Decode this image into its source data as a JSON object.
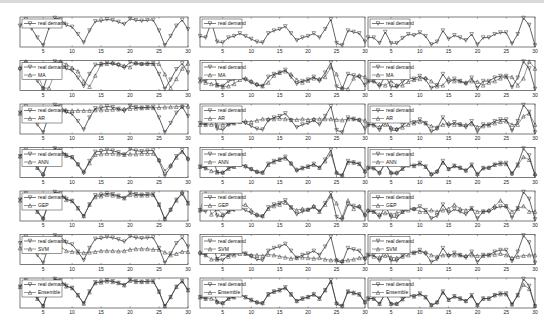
{
  "chart_data": {
    "type": "line",
    "layout": "3 columns x 7 rows of small-multiple line plots",
    "x": [
      1,
      2,
      3,
      4,
      5,
      6,
      7,
      8,
      9,
      10,
      11,
      12,
      13,
      14,
      15,
      16,
      17,
      18,
      19,
      20,
      21,
      22,
      23,
      24,
      25,
      26,
      27,
      28,
      29,
      30
    ],
    "xlim": [
      1,
      30
    ],
    "x_ticks": [
      "5",
      "10",
      "15",
      "20",
      "25",
      "30"
    ],
    "ylim": [
      0,
      1
    ],
    "y_note": "values are relative (normalized) demand levels estimated from plot heights; y tick labels are not legible",
    "row_models": [
      "",
      "MA",
      "AR",
      "ANN",
      "GEP",
      "SVM",
      "Ensemble"
    ],
    "legend_real_label": "real demand",
    "columns": [
      {
        "name": "series-1",
        "real": [
          0.72,
          0.95,
          0.62,
          0.3,
          0.02,
          0.65,
          1,
          0.95,
          0.75,
          0.68,
          0.42,
          0.12,
          0.55,
          0.88,
          0.9,
          0.95,
          0.92,
          0.86,
          0.78,
          0.97,
          0.92,
          0.9,
          0.92,
          0.93,
          0.55,
          0.02,
          0.35,
          0.72,
          0.93,
          0.6
        ],
        "models": {
          "MA": [
            0.78,
            1,
            0.78,
            0.55,
            0.05,
            0.05,
            0.6,
            1,
            0.9,
            0.78,
            0.65,
            0.3,
            0.1,
            0.5,
            0.9,
            0.92,
            0.95,
            0.92,
            0.85,
            0.8,
            0.95,
            0.92,
            0.92,
            0.92,
            0.92,
            0.55,
            0.05,
            0.38,
            0.75,
            0.93
          ],
          "AR": [
            0.7,
            0.72,
            0.72,
            0.72,
            0.72,
            0.72,
            0.74,
            0.78,
            0.8,
            0.8,
            0.8,
            0.8,
            0.8,
            0.82,
            0.82,
            0.83,
            0.84,
            0.85,
            0.86,
            0.87,
            0.88,
            0.89,
            0.9,
            0.9,
            0.91,
            0.92,
            0.93,
            0.94,
            0.95,
            0.95
          ],
          "ANN": [
            0.72,
            0.9,
            0.62,
            0.32,
            0.1,
            0.6,
            0.95,
            0.9,
            0.75,
            0.7,
            0.45,
            0.18,
            0.48,
            0.78,
            0.8,
            0.82,
            0.82,
            0.8,
            0.78,
            0.8,
            0.8,
            0.82,
            0.82,
            0.82,
            0.6,
            0.2,
            0.4,
            0.68,
            0.88,
            0.65
          ],
          "GEP": [
            0.7,
            0.92,
            0.6,
            0.3,
            0.08,
            0.62,
            0.95,
            0.9,
            0.72,
            0.68,
            0.42,
            0.15,
            0.55,
            0.82,
            0.85,
            0.9,
            0.88,
            0.84,
            0.78,
            0.9,
            0.88,
            0.88,
            0.88,
            0.9,
            0.55,
            0.05,
            0.38,
            0.7,
            1,
            0.6
          ],
          "SVM": [
            0.55,
            0.6,
            0.5,
            0.45,
            0.4,
            0.45,
            0.55,
            0.6,
            0.45,
            0.42,
            0.4,
            0.38,
            0.4,
            0.42,
            0.45,
            0.45,
            0.45,
            0.44,
            0.45,
            0.5,
            0.52,
            0.52,
            0.52,
            0.5,
            0.5,
            0.4,
            0.3,
            0.35,
            0.42,
            0.42
          ],
          "Ensemble": [
            0.72,
            0.93,
            0.62,
            0.3,
            0.05,
            0.63,
            0.98,
            0.93,
            0.74,
            0.68,
            0.42,
            0.13,
            0.53,
            0.86,
            0.88,
            0.92,
            0.9,
            0.86,
            0.78,
            0.94,
            0.9,
            0.9,
            0.9,
            0.91,
            0.55,
            0.04,
            0.36,
            0.72,
            0.92,
            0.6
          ]
        }
      },
      {
        "name": "series-2",
        "real": [
          0.35,
          0.3,
          0.85,
          0.15,
          0.12,
          0.3,
          0.35,
          0.45,
          0.35,
          0.25,
          0.15,
          0.12,
          0.45,
          0.55,
          0.6,
          0.7,
          0.45,
          0.2,
          0.3,
          0.35,
          0.45,
          0.3,
          0.6,
          0.95,
          0.1,
          0.02,
          0.55,
          0.5,
          0.45,
          0.15
        ],
        "models": {
          "MA": [
            0.3,
            0.25,
            0.2,
            0.15,
            0.1,
            0.12,
            0.2,
            0.35,
            0.4,
            0.3,
            0.2,
            0.12,
            0.25,
            0.5,
            0.6,
            0.65,
            0.55,
            0.35,
            0.25,
            0.32,
            0.4,
            0.38,
            0.45,
            0.8,
            0.55,
            0.05,
            0.02,
            0.4,
            0.5,
            0.45
          ],
          "AR": [
            0.3,
            0.3,
            0.3,
            0.28,
            0.3,
            0.32,
            0.35,
            0.4,
            0.42,
            0.4,
            0.45,
            0.5,
            0.5,
            0.5,
            0.52,
            0.5,
            0.48,
            0.48,
            0.5,
            0.48,
            0.5,
            0.5,
            0.5,
            0.5,
            0.48,
            0.46,
            0.5,
            0.5,
            0.48,
            0.45
          ],
          "ANN": [
            0.35,
            0.3,
            0.2,
            0.15,
            0.15,
            0.28,
            0.35,
            0.42,
            0.38,
            0.28,
            0.18,
            0.15,
            0.42,
            0.52,
            0.6,
            0.65,
            0.48,
            0.25,
            0.3,
            0.35,
            0.42,
            0.32,
            0.55,
            0.8,
            0.15,
            0.05,
            0.5,
            0.5,
            0.45,
            0.2
          ],
          "GEP": [
            0.35,
            0.95,
            0.2,
            0.4,
            0.2,
            0.3,
            0.45,
            0.5,
            0.55,
            0.35,
            0.2,
            0.15,
            0.4,
            0.5,
            0.55,
            0.62,
            0.45,
            0.35,
            0.4,
            0.38,
            0.5,
            0.3,
            0.55,
            0.85,
            0.6,
            0.1,
            0.7,
            0.4,
            0.5,
            0.2
          ],
          "SVM": [
            0.4,
            0.3,
            0.15,
            0.15,
            0.35,
            0.25,
            0.3,
            0.35,
            0.35,
            0.3,
            0.3,
            0.28,
            0.32,
            0.3,
            0.25,
            0.22,
            0.18,
            0.2,
            0.22,
            0.2,
            0.18,
            0.2,
            0.15,
            0.12,
            0.12,
            0.1,
            0.12,
            0.15,
            0.2,
            0.2
          ],
          "Ensemble": [
            0.35,
            0.3,
            0.3,
            0.2,
            0.15,
            0.3,
            0.35,
            0.45,
            0.35,
            0.25,
            0.18,
            0.15,
            0.45,
            0.55,
            0.6,
            0.68,
            0.45,
            0.22,
            0.3,
            0.36,
            0.45,
            0.3,
            0.6,
            0.9,
            0.15,
            0.05,
            0.55,
            0.5,
            0.45,
            0.18
          ]
        }
      },
      {
        "name": "series-3",
        "real": [
          0.3,
          0.3,
          0.1,
          0.5,
          0.1,
          0.1,
          0.28,
          0.42,
          0.38,
          0.48,
          0.35,
          0.05,
          0.15,
          0.55,
          0.25,
          0.38,
          0.3,
          0.2,
          0.42,
          0.05,
          0.3,
          0.3,
          0.42,
          0.48,
          0.48,
          0.08,
          0.42,
          1,
          0.75,
          0.02
        ],
        "models": {
          "MA": [
            0.3,
            0.3,
            0.2,
            0.15,
            0.3,
            0.15,
            0.15,
            0.28,
            0.35,
            0.38,
            0.42,
            0.3,
            0.12,
            0.15,
            0.4,
            0.3,
            0.3,
            0.25,
            0.3,
            0.28,
            0.15,
            0.25,
            0.3,
            0.4,
            0.45,
            0.45,
            0.15,
            0.4,
            1,
            0.75
          ],
          "AR": [
            0.3,
            0.28,
            0.22,
            0.3,
            0.2,
            0.15,
            0.2,
            0.3,
            0.35,
            0.4,
            0.35,
            0.25,
            0.2,
            0.3,
            0.35,
            0.3,
            0.3,
            0.3,
            0.32,
            0.22,
            0.25,
            0.28,
            0.35,
            0.4,
            0.42,
            0.3,
            0.3,
            0.6,
            0.7,
            0.3
          ],
          "ANN": [
            0.32,
            0.3,
            0.15,
            0.45,
            0.15,
            0.15,
            0.28,
            0.4,
            0.38,
            0.45,
            0.35,
            0.1,
            0.2,
            0.5,
            0.28,
            0.38,
            0.32,
            0.22,
            0.4,
            0.1,
            0.3,
            0.32,
            0.42,
            0.45,
            0.45,
            0.12,
            0.4,
            0.7,
            0.6,
            0.1
          ],
          "GEP": [
            0.35,
            0.3,
            0.2,
            0.25,
            0.2,
            0.25,
            0.3,
            0.35,
            0.4,
            0.3,
            0.3,
            0.35,
            0.3,
            0.35,
            0.4,
            0.55,
            0.4,
            0.35,
            0.4,
            0.3,
            0.3,
            0.35,
            0.5,
            0.7,
            0.5,
            0.3,
            0.4,
            0.5,
            0.3,
            0.3
          ],
          "SVM": [
            0.3,
            0.25,
            0.22,
            0.28,
            0.22,
            0.2,
            0.25,
            0.3,
            0.38,
            0.42,
            0.4,
            0.3,
            0.25,
            0.3,
            0.32,
            0.3,
            0.3,
            0.28,
            0.3,
            0.28,
            0.28,
            0.3,
            0.32,
            0.35,
            0.3,
            0.2,
            0.25,
            0.28,
            0.3,
            0.3
          ],
          "Ensemble": [
            0.3,
            0.3,
            0.12,
            0.48,
            0.12,
            0.12,
            0.28,
            0.42,
            0.38,
            0.46,
            0.35,
            0.08,
            0.18,
            0.52,
            0.26,
            0.38,
            0.3,
            0.22,
            0.4,
            0.08,
            0.3,
            0.3,
            0.42,
            0.46,
            0.46,
            0.1,
            0.42,
            0.8,
            0.65,
            0.05
          ]
        }
      }
    ]
  }
}
